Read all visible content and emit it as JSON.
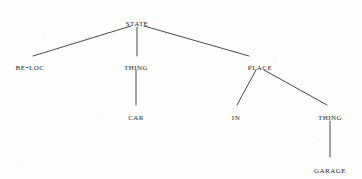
{
  "figure": {
    "kind": "semantic-tree-diagram",
    "background_color": "#fdfdfc",
    "ink_color": "#27262a",
    "edge_color": "#4a484c"
  },
  "nodes": [
    {
      "id": "state",
      "label": "STATE",
      "x": 137,
      "y": 18,
      "level": 0
    },
    {
      "id": "be-loc",
      "label": "BE-loc",
      "x": 30,
      "y": 62,
      "level": 1
    },
    {
      "id": "thing-left",
      "label": "THING",
      "x": 136,
      "y": 62,
      "level": 1
    },
    {
      "id": "place",
      "label": "PLACE",
      "x": 260,
      "y": 62,
      "level": 1
    },
    {
      "id": "car",
      "label": "CAR",
      "x": 136,
      "y": 112,
      "level": 2
    },
    {
      "id": "in",
      "label": "IN",
      "x": 236,
      "y": 112,
      "level": 2
    },
    {
      "id": "thing-right",
      "label": "THING",
      "x": 330,
      "y": 112,
      "level": 2
    },
    {
      "id": "garage",
      "label": "GARAGE",
      "x": 330,
      "y": 165,
      "level": 3
    }
  ],
  "beloc_parts": {
    "head": "BE",
    "hyphen": "-",
    "tail": "loc"
  },
  "edges": [
    {
      "id": "state-beloc",
      "from": "state",
      "to": "be-loc",
      "x1": 131,
      "y1": 26,
      "x2": 33,
      "y2": 56
    },
    {
      "id": "state-thing-left",
      "from": "state",
      "to": "thing-left",
      "x1": 137,
      "y1": 27,
      "x2": 137,
      "y2": 56
    },
    {
      "id": "state-place",
      "from": "state",
      "to": "place",
      "x1": 144,
      "y1": 26,
      "x2": 249,
      "y2": 56
    },
    {
      "id": "thing-left-car",
      "from": "thing-left",
      "to": "car",
      "x1": 136,
      "y1": 70,
      "x2": 136,
      "y2": 105
    },
    {
      "id": "place-in",
      "from": "place",
      "to": "in",
      "x1": 256,
      "y1": 70,
      "x2": 237,
      "y2": 105
    },
    {
      "id": "place-thing-right",
      "from": "place",
      "to": "thing-right",
      "x1": 264,
      "y1": 70,
      "x2": 327,
      "y2": 105
    },
    {
      "id": "thing-right-garage",
      "from": "thing-right",
      "to": "garage",
      "x1": 330,
      "y1": 121,
      "x2": 330,
      "y2": 157
    }
  ]
}
